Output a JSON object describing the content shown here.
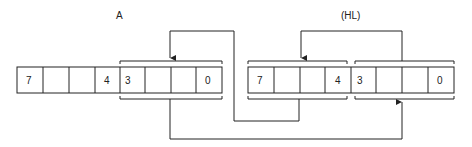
{
  "diagram": {
    "labels": {
      "register_a": "A",
      "register_hl": "(HL)"
    },
    "register_a": {
      "cells": [
        "7",
        "",
        "",
        "4",
        "3",
        "",
        "",
        "0"
      ]
    },
    "register_hl": {
      "cells": [
        "7",
        "",
        "",
        "4",
        "3",
        "",
        "",
        "0"
      ]
    },
    "colors": {
      "line": "#222222",
      "background": "#ffffff"
    }
  }
}
